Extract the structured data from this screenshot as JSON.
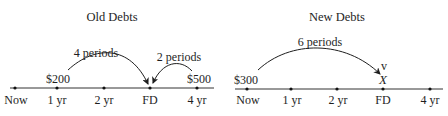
{
  "panels": [
    {
      "title": "Old Debts",
      "tick_labels": [
        "Now",
        "1 yr",
        "2 yr",
        "FD",
        "4 yr"
      ],
      "amounts": [
        {
          "label": "$200",
          "at": "1 yr"
        },
        {
          "label": "$500",
          "at": "4 yr"
        }
      ],
      "arcs": [
        {
          "label": "4 periods",
          "from": "1 yr",
          "to": "FD"
        },
        {
          "label": "2 periods",
          "from": "4 yr",
          "to": "FD"
        }
      ]
    },
    {
      "title": "New Debts",
      "tick_labels": [
        "Now",
        "1 yr",
        "2 yr",
        "FD",
        "4 yr"
      ],
      "amounts": [
        {
          "label": "$300",
          "at": "Now"
        },
        {
          "label": "X",
          "at": "FD"
        }
      ],
      "arcs": [
        {
          "label": "6 periods",
          "from": "Now",
          "to": "FD"
        }
      ]
    }
  ],
  "colors": {
    "ink": "#1e1e1e",
    "background": "#ffffff"
  }
}
